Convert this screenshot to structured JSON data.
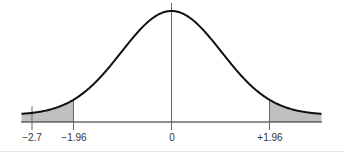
{
  "chart_data": {
    "type": "line",
    "title": "",
    "xlabel": "",
    "ylabel": "",
    "xlim": [
      -3,
      3
    ],
    "ylim": [
      0,
      0.4
    ],
    "grid": false,
    "legend": null,
    "series": [
      {
        "name": "standard normal pdf",
        "x": [
          -3,
          -2.7,
          -2.5,
          -2,
          -1.96,
          -1.5,
          -1,
          -0.5,
          0,
          0.5,
          1,
          1.5,
          1.96,
          2,
          2.5,
          3
        ],
        "values": [
          0.0044,
          0.0104,
          0.0175,
          0.054,
          0.0584,
          0.1295,
          0.242,
          0.3521,
          0.3989,
          0.3521,
          0.242,
          0.1295,
          0.0584,
          0.054,
          0.0175,
          0.0044
        ]
      }
    ],
    "shaded_regions": [
      {
        "name": "left tail",
        "from": -3,
        "to": -1.96
      },
      {
        "name": "right tail",
        "from": 1.96,
        "to": 3
      }
    ],
    "vertical_markers": [
      {
        "x": -2.7,
        "label": "−2.7"
      },
      {
        "x": -1.96,
        "label": "−1.96"
      },
      {
        "x": 0,
        "label": "0"
      },
      {
        "x": 1.96,
        "label": "+1.96"
      }
    ],
    "tick_labels": [
      "−2.7",
      "−1.96",
      "0",
      "+1.96"
    ]
  },
  "colors": {
    "curve": "#111111",
    "axis": "#222222",
    "marker": "#666666",
    "shade": "#c0c0c0"
  }
}
